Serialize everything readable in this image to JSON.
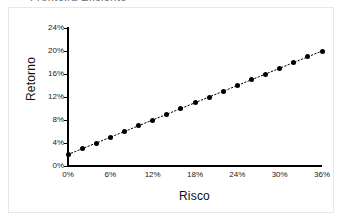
{
  "figure": {
    "clipped_title": "Fronteira Eficiente",
    "background_color": "#ffffff",
    "frame_color": "#e8e8e8",
    "marker_color": "#000000",
    "axis_color": "#000000"
  },
  "chart_data": {
    "type": "scatter",
    "title": "",
    "xlabel": "Risco",
    "ylabel": "Retorno",
    "x": [
      0,
      2,
      4,
      6,
      8,
      10,
      12,
      14,
      16,
      18,
      20,
      22,
      24,
      26,
      28,
      30,
      32,
      34,
      36
    ],
    "y": [
      2,
      3,
      4,
      5,
      6,
      7,
      8,
      9,
      10,
      11,
      12,
      13,
      14,
      15,
      16,
      17,
      18,
      19,
      20
    ],
    "values": [
      2,
      3,
      4,
      5,
      6,
      7,
      8,
      9,
      10,
      11,
      12,
      13,
      14,
      15,
      16,
      17,
      18,
      19,
      20
    ],
    "series": [
      {
        "name": "Fronteira",
        "x": [
          0,
          2,
          4,
          6,
          8,
          10,
          12,
          14,
          16,
          18,
          20,
          22,
          24,
          26,
          28,
          30,
          32,
          34,
          36
        ],
        "values": [
          2,
          3,
          4,
          5,
          6,
          7,
          8,
          9,
          10,
          11,
          12,
          13,
          14,
          15,
          16,
          17,
          18,
          19,
          20
        ],
        "marker": "filled-circle",
        "line_style": "dotted"
      }
    ],
    "xlim": [
      0,
      36
    ],
    "ylim": [
      0,
      24
    ],
    "xticks": [
      0,
      6,
      12,
      18,
      24,
      30,
      36
    ],
    "yticks": [
      0,
      4,
      8,
      12,
      16,
      20,
      24
    ],
    "xtick_labels": [
      "0%",
      "6%",
      "12%",
      "18%",
      "24%",
      "30%",
      "36%"
    ],
    "ytick_labels": [
      "0%",
      "4%",
      "8%",
      "12%",
      "16%",
      "20%",
      "24%"
    ],
    "grid": false,
    "legend": false,
    "legend_position": "none",
    "annotations": []
  }
}
